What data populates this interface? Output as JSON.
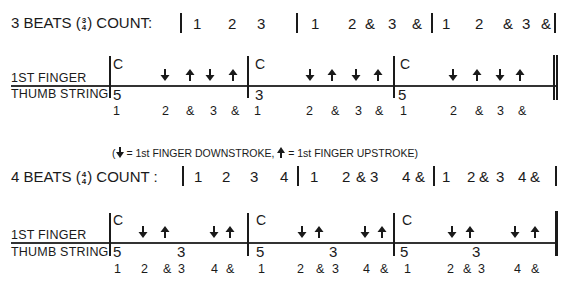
{
  "section_3_4": {
    "header": {
      "prefix": "3 BEATS (",
      "time_sig_top": "3",
      "time_sig_bottom": "4",
      "suffix": ") COUNT:",
      "counts": [
        {
          "x": 193,
          "text": "1"
        },
        {
          "x": 228,
          "text": "2"
        },
        {
          "x": 257,
          "text": "3"
        },
        {
          "x": 311,
          "text": "1"
        },
        {
          "x": 348,
          "text": "2"
        },
        {
          "x": 365,
          "text": "&"
        },
        {
          "x": 388,
          "text": "3"
        },
        {
          "x": 412,
          "text": "&"
        },
        {
          "x": 442,
          "text": "1"
        },
        {
          "x": 475,
          "text": "2"
        },
        {
          "x": 503,
          "text": "&"
        },
        {
          "x": 522,
          "text": "3"
        },
        {
          "x": 541,
          "text": "&"
        }
      ]
    },
    "staff": {
      "label_top": "1ST FINGER",
      "label_bottom": "THUMB STRING",
      "measures": [
        {
          "chord": "C",
          "thumb": [
            {
              "x": 113,
              "text": "5"
            }
          ]
        },
        {
          "chord": "C",
          "thumb": [
            {
              "x": 255,
              "text": "3"
            }
          ]
        },
        {
          "chord": "C",
          "thumb": [
            {
              "x": 398,
              "text": "5"
            }
          ]
        }
      ],
      "strokes": [
        {
          "x": 160,
          "dir": "down"
        },
        {
          "x": 185,
          "dir": "up"
        },
        {
          "x": 205,
          "dir": "down"
        },
        {
          "x": 228,
          "dir": "up"
        },
        {
          "x": 305,
          "dir": "down"
        },
        {
          "x": 327,
          "dir": "up"
        },
        {
          "x": 351,
          "dir": "down"
        },
        {
          "x": 373,
          "dir": "up"
        },
        {
          "x": 448,
          "dir": "down"
        },
        {
          "x": 472,
          "dir": "up"
        },
        {
          "x": 495,
          "dir": "down"
        },
        {
          "x": 515,
          "dir": "up"
        }
      ],
      "beats": [
        {
          "x": 113,
          "text": "1"
        },
        {
          "x": 162,
          "text": "2"
        },
        {
          "x": 186,
          "text": "&"
        },
        {
          "x": 210,
          "text": "3"
        },
        {
          "x": 231,
          "text": "&"
        },
        {
          "x": 254,
          "text": "1"
        },
        {
          "x": 306,
          "text": "2"
        },
        {
          "x": 331,
          "text": "&"
        },
        {
          "x": 355,
          "text": "3"
        },
        {
          "x": 375,
          "text": "&"
        },
        {
          "x": 400,
          "text": "1"
        },
        {
          "x": 450,
          "text": "2"
        },
        {
          "x": 475,
          "text": "&"
        },
        {
          "x": 497,
          "text": "3"
        },
        {
          "x": 518,
          "text": "&"
        }
      ]
    }
  },
  "legend": {
    "open": "(",
    "down_text": "= 1st FINGER DOWNSTROKE,",
    "up_text": "= 1st FINGER UPSTROKE)"
  },
  "section_4_4": {
    "header": {
      "prefix": "4 BEATS (",
      "time_sig_top": "4",
      "time_sig_bottom": "4",
      "suffix": ") COUNT :",
      "counts": [
        {
          "x": 194,
          "text": "1"
        },
        {
          "x": 222,
          "text": "2"
        },
        {
          "x": 250,
          "text": "3"
        },
        {
          "x": 280,
          "text": "4"
        },
        {
          "x": 310,
          "text": "1"
        },
        {
          "x": 342,
          "text": "2"
        },
        {
          "x": 356,
          "text": "&"
        },
        {
          "x": 370,
          "text": "3"
        },
        {
          "x": 402,
          "text": "4"
        },
        {
          "x": 415,
          "text": "&"
        },
        {
          "x": 442,
          "text": "1"
        },
        {
          "x": 467,
          "text": "2"
        },
        {
          "x": 479,
          "text": "&"
        },
        {
          "x": 496,
          "text": "3"
        },
        {
          "x": 518,
          "text": "4"
        },
        {
          "x": 530,
          "text": "&"
        }
      ]
    },
    "staff": {
      "label_top": "1ST FINGER",
      "label_bottom": "THUMB STRING",
      "measures": [
        {
          "chord": "C",
          "thumb": [
            {
              "x": 113,
              "text": "5"
            },
            {
              "x": 177,
              "text": "3"
            }
          ]
        },
        {
          "chord": "C",
          "thumb": [
            {
              "x": 256,
              "text": "5"
            },
            {
              "x": 329,
              "text": "3"
            }
          ]
        },
        {
          "chord": "C",
          "thumb": [
            {
              "x": 400,
              "text": "5"
            },
            {
              "x": 472,
              "text": "3"
            }
          ]
        }
      ],
      "strokes": [
        {
          "x": 138,
          "dir": "down"
        },
        {
          "x": 160,
          "dir": "up"
        },
        {
          "x": 209,
          "dir": "down"
        },
        {
          "x": 225,
          "dir": "up"
        },
        {
          "x": 297,
          "dir": "down"
        },
        {
          "x": 314,
          "dir": "up"
        },
        {
          "x": 360,
          "dir": "down"
        },
        {
          "x": 377,
          "dir": "up"
        },
        {
          "x": 447,
          "dir": "down"
        },
        {
          "x": 465,
          "dir": "up"
        },
        {
          "x": 510,
          "dir": "down"
        },
        {
          "x": 530,
          "dir": "up"
        }
      ],
      "beats": [
        {
          "x": 114,
          "text": "1"
        },
        {
          "x": 141,
          "text": "2"
        },
        {
          "x": 163,
          "text": "&"
        },
        {
          "x": 178,
          "text": "3"
        },
        {
          "x": 211,
          "text": "4"
        },
        {
          "x": 226,
          "text": "&"
        },
        {
          "x": 258,
          "text": "1"
        },
        {
          "x": 297,
          "text": "2"
        },
        {
          "x": 316,
          "text": "&"
        },
        {
          "x": 332,
          "text": "3"
        },
        {
          "x": 363,
          "text": "4"
        },
        {
          "x": 380,
          "text": "&"
        },
        {
          "x": 404,
          "text": "1"
        },
        {
          "x": 447,
          "text": "2"
        },
        {
          "x": 463,
          "text": "&"
        },
        {
          "x": 478,
          "text": "3"
        },
        {
          "x": 514,
          "text": "4"
        },
        {
          "x": 531,
          "text": "&"
        }
      ]
    }
  }
}
